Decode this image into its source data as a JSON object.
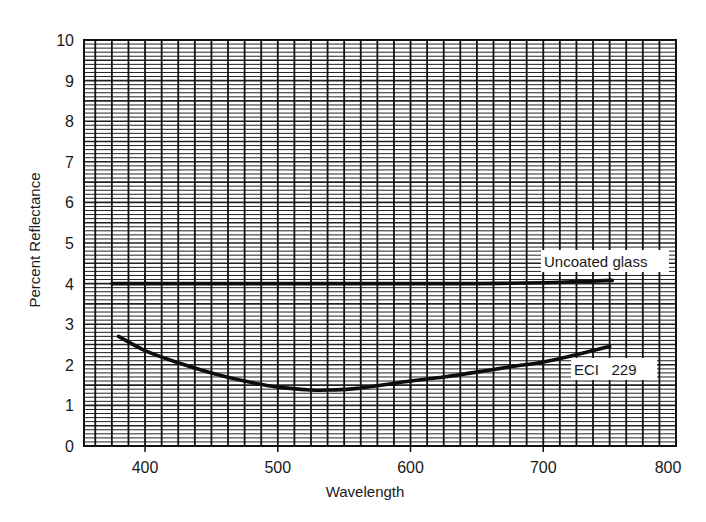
{
  "chart_data": {
    "type": "line",
    "title": "",
    "xlabel": "Wavelength",
    "ylabel": "Percent Reflectance",
    "xlim": [
      354,
      800
    ],
    "ylim": [
      0,
      10
    ],
    "x_ticks": [
      400,
      500,
      600,
      700,
      800
    ],
    "y_ticks": [
      0,
      1,
      2,
      3,
      4,
      5,
      6,
      7,
      8,
      9,
      10
    ],
    "grid": true,
    "legend_position": "inline labels near right end of each curve",
    "series": [
      {
        "name": "Uncoated glass",
        "x": [
          375,
          400,
          450,
          500,
          550,
          600,
          650,
          700,
          725,
          752
        ],
        "y": [
          4.0,
          4.0,
          4.0,
          4.0,
          4.0,
          4.0,
          4.0,
          4.02,
          4.05,
          4.08
        ]
      },
      {
        "name": "ECI 229",
        "x": [
          380,
          400,
          425,
          450,
          475,
          500,
          525,
          540,
          560,
          600,
          625,
          650,
          675,
          700,
          725,
          750
        ],
        "y": [
          2.7,
          2.35,
          2.05,
          1.8,
          1.6,
          1.45,
          1.38,
          1.38,
          1.42,
          1.6,
          1.7,
          1.82,
          1.95,
          2.07,
          2.25,
          2.45
        ]
      }
    ],
    "annotations": [
      {
        "text": "Uncoated glass",
        "series": "Uncoated glass"
      },
      {
        "text": "ECI   229",
        "series": "ECI 229"
      }
    ]
  },
  "labels": {
    "uncoated": "Uncoated glass",
    "eci": "ECI   229"
  }
}
